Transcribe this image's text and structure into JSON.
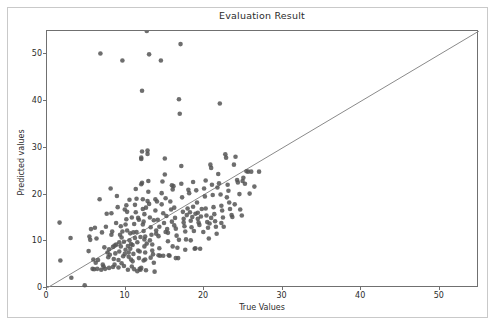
{
  "chart_data": {
    "type": "scatter",
    "title": "Evaluation Result",
    "xlabel": "True Values",
    "ylabel": "Predicted values",
    "xlim": [
      0,
      55
    ],
    "ylim": [
      0,
      55
    ],
    "xticks": [
      0,
      10,
      20,
      30,
      40,
      50
    ],
    "yticks": [
      0,
      10,
      20,
      30,
      40,
      50
    ],
    "grid": false,
    "legend": null,
    "marker_color": "#555555",
    "marker_size": 4.6,
    "marker_alpha": 0.85,
    "reference_line": {
      "name": "identity-line",
      "from": [
        0,
        0
      ],
      "to": [
        55,
        55
      ],
      "color": "#8a8a8a",
      "width": 1
    },
    "points": [
      [
        1.6,
        14.0
      ],
      [
        1.7,
        5.9
      ],
      [
        3.0,
        10.7
      ],
      [
        3.1,
        2.2
      ],
      [
        4.8,
        0.6
      ],
      [
        5.3,
        7.9
      ],
      [
        5.4,
        11.0
      ],
      [
        5.5,
        10.3
      ],
      [
        5.6,
        12.6
      ],
      [
        5.8,
        4.1
      ],
      [
        6.0,
        4.0
      ],
      [
        6.1,
        12.9
      ],
      [
        6.2,
        5.4
      ],
      [
        6.4,
        4.1
      ],
      [
        6.5,
        6.0
      ],
      [
        6.7,
        19.0
      ],
      [
        6.8,
        50.2
      ],
      [
        6.9,
        3.9
      ],
      [
        7.0,
        11.9
      ],
      [
        7.1,
        5.0
      ],
      [
        7.2,
        4.6
      ],
      [
        7.4,
        4.1
      ],
      [
        7.5,
        13.1
      ],
      [
        7.6,
        15.9
      ],
      [
        7.7,
        7.6
      ],
      [
        7.8,
        6.6
      ],
      [
        7.9,
        8.3
      ],
      [
        8.0,
        7.1
      ],
      [
        8.1,
        21.3
      ],
      [
        8.2,
        16.0
      ],
      [
        8.3,
        12.1
      ],
      [
        8.4,
        8.8
      ],
      [
        8.5,
        6.2
      ],
      [
        8.6,
        5.0
      ],
      [
        8.7,
        7.4
      ],
      [
        8.8,
        9.3
      ],
      [
        8.9,
        19.7
      ],
      [
        9.0,
        17.3
      ],
      [
        9.1,
        6.0
      ],
      [
        9.2,
        7.8
      ],
      [
        9.3,
        11.4
      ],
      [
        9.4,
        8.9
      ],
      [
        9.5,
        5.3
      ],
      [
        9.6,
        48.7
      ],
      [
        9.7,
        6.8
      ],
      [
        9.8,
        9.9
      ],
      [
        9.9,
        7.3
      ],
      [
        10.0,
        13.6
      ],
      [
        10.1,
        17.7
      ],
      [
        10.2,
        16.3
      ],
      [
        10.3,
        9.0
      ],
      [
        10.4,
        7.6
      ],
      [
        10.5,
        10.2
      ],
      [
        10.6,
        8.4
      ],
      [
        10.7,
        6.1
      ],
      [
        10.8,
        4.6
      ],
      [
        10.9,
        9.2
      ],
      [
        11.0,
        11.9
      ],
      [
        11.1,
        13.7
      ],
      [
        11.2,
        17.8
      ],
      [
        11.3,
        16.2
      ],
      [
        11.4,
        12.0
      ],
      [
        11.5,
        9.8
      ],
      [
        11.6,
        8.0
      ],
      [
        11.7,
        6.4
      ],
      [
        11.8,
        4.1
      ],
      [
        11.9,
        3.9
      ],
      [
        12.0,
        27.6
      ],
      [
        12.0,
        27.9
      ],
      [
        12.0,
        22.2
      ],
      [
        12.1,
        22.5
      ],
      [
        12.1,
        42.2
      ],
      [
        12.2,
        19.0
      ],
      [
        12.2,
        16.9
      ],
      [
        12.3,
        14.2
      ],
      [
        12.3,
        12.2
      ],
      [
        12.4,
        10.4
      ],
      [
        12.4,
        8.9
      ],
      [
        12.5,
        7.6
      ],
      [
        12.5,
        6.1
      ],
      [
        12.6,
        3.8
      ],
      [
        12.7,
        55.0
      ],
      [
        12.8,
        29.4
      ],
      [
        12.8,
        28.7
      ],
      [
        12.9,
        22.9
      ],
      [
        13.0,
        50.0
      ],
      [
        13.0,
        18.0
      ],
      [
        13.1,
        15.1
      ],
      [
        13.2,
        13.0
      ],
      [
        13.3,
        11.4
      ],
      [
        13.4,
        9.3
      ],
      [
        13.5,
        7.2
      ],
      [
        13.6,
        5.4
      ],
      [
        13.7,
        3.5
      ],
      [
        13.8,
        16.6
      ],
      [
        13.9,
        12.3
      ],
      [
        14.0,
        18.5
      ],
      [
        14.1,
        14.6
      ],
      [
        14.2,
        11.1
      ],
      [
        14.3,
        8.5
      ],
      [
        14.4,
        6.9
      ],
      [
        14.5,
        48.7
      ],
      [
        14.6,
        17.9
      ],
      [
        14.7,
        22.8
      ],
      [
        14.8,
        16.0
      ],
      [
        14.9,
        13.9
      ],
      [
        15.0,
        27.7
      ],
      [
        15.0,
        24.3
      ],
      [
        15.1,
        19.2
      ],
      [
        15.2,
        15.4
      ],
      [
        15.3,
        12.6
      ],
      [
        15.4,
        10.0
      ],
      [
        15.5,
        7.0
      ],
      [
        15.6,
        6.9
      ],
      [
        15.7,
        18.5
      ],
      [
        15.8,
        16.8
      ],
      [
        15.9,
        14.2
      ],
      [
        16.0,
        21.1
      ],
      [
        16.1,
        21.8
      ],
      [
        16.2,
        17.2
      ],
      [
        16.3,
        15.0
      ],
      [
        16.4,
        12.7
      ],
      [
        16.5,
        11.2
      ],
      [
        16.6,
        8.6
      ],
      [
        16.7,
        6.4
      ],
      [
        16.8,
        40.4
      ],
      [
        16.9,
        37.3
      ],
      [
        17.0,
        52.2
      ],
      [
        17.1,
        26.1
      ],
      [
        17.2,
        19.4
      ],
      [
        17.3,
        16.3
      ],
      [
        17.4,
        14.8
      ],
      [
        17.5,
        13.2
      ],
      [
        17.6,
        12.1
      ],
      [
        17.7,
        10.4
      ],
      [
        17.8,
        15.6
      ],
      [
        17.9,
        17.0
      ],
      [
        18.0,
        21.0
      ],
      [
        18.1,
        20.3
      ],
      [
        18.2,
        16.2
      ],
      [
        18.3,
        14.4
      ],
      [
        18.4,
        13.0
      ],
      [
        18.5,
        15.2
      ],
      [
        18.6,
        17.4
      ],
      [
        18.7,
        12.2
      ],
      [
        18.8,
        8.4
      ],
      [
        18.9,
        15.9
      ],
      [
        19.0,
        20.9
      ],
      [
        19.1,
        18.3
      ],
      [
        19.2,
        16.1
      ],
      [
        19.3,
        14.0
      ],
      [
        19.4,
        13.5
      ],
      [
        19.5,
        8.4
      ],
      [
        19.6,
        15.3
      ],
      [
        19.7,
        16.9
      ],
      [
        20.0,
        21.3
      ],
      [
        20.1,
        19.6
      ],
      [
        20.2,
        17.0
      ],
      [
        20.3,
        15.5
      ],
      [
        20.4,
        14.1
      ],
      [
        20.5,
        12.9
      ],
      [
        20.6,
        10.6
      ],
      [
        20.8,
        26.4
      ],
      [
        20.9,
        25.7
      ],
      [
        21.0,
        22.1
      ],
      [
        21.1,
        19.9
      ],
      [
        21.2,
        17.3
      ],
      [
        21.3,
        15.8
      ],
      [
        21.4,
        14.3
      ],
      [
        21.5,
        13.1
      ],
      [
        21.6,
        11.6
      ],
      [
        21.8,
        24.4
      ],
      [
        21.9,
        22.4
      ],
      [
        22.0,
        39.5
      ],
      [
        22.1,
        20.0
      ],
      [
        22.2,
        17.6
      ],
      [
        22.3,
        16.6
      ],
      [
        22.4,
        15.1
      ],
      [
        22.5,
        13.1
      ],
      [
        22.7,
        28.6
      ],
      [
        22.8,
        27.9
      ],
      [
        23.0,
        22.1
      ],
      [
        23.1,
        20.8
      ],
      [
        23.2,
        18.3
      ],
      [
        23.3,
        16.9
      ],
      [
        23.5,
        15.6
      ],
      [
        23.8,
        26.4
      ],
      [
        24.0,
        28.1
      ],
      [
        24.2,
        23.1
      ],
      [
        24.3,
        22.6
      ],
      [
        24.5,
        20.1
      ],
      [
        24.6,
        16.8
      ],
      [
        24.8,
        15.5
      ],
      [
        25.0,
        23.6
      ],
      [
        25.2,
        22.3
      ],
      [
        25.4,
        25.0
      ],
      [
        25.6,
        24.9
      ],
      [
        26.0,
        24.9
      ],
      [
        26.4,
        21.7
      ],
      [
        27.0,
        24.9
      ],
      [
        9.4,
        13.2
      ],
      [
        10.2,
        12.3
      ],
      [
        11.2,
        10.7
      ],
      [
        11.6,
        15.0
      ],
      [
        12.2,
        13.6
      ],
      [
        13.1,
        10.2
      ],
      [
        10.9,
        5.7
      ],
      [
        11.1,
        4.0
      ],
      [
        11.5,
        3.6
      ],
      [
        12.0,
        4.3
      ],
      [
        9.8,
        4.7
      ],
      [
        10.3,
        3.9
      ],
      [
        9.1,
        4.4
      ],
      [
        8.4,
        4.5
      ],
      [
        7.9,
        4.3
      ],
      [
        13.4,
        8.0
      ],
      [
        14.2,
        7.0
      ],
      [
        14.8,
        6.9
      ],
      [
        16.0,
        8.9
      ],
      [
        12.7,
        9.5
      ],
      [
        11.9,
        10.9
      ],
      [
        10.6,
        11.7
      ],
      [
        12.6,
        17.2
      ],
      [
        13.8,
        19.0
      ],
      [
        12.9,
        20.6
      ],
      [
        11.3,
        21.2
      ],
      [
        12.1,
        29.2
      ],
      [
        19.9,
        12.0
      ],
      [
        20.7,
        13.8
      ],
      [
        18.3,
        10.2
      ],
      [
        16.8,
        10.3
      ],
      [
        15.4,
        11.8
      ],
      [
        14.3,
        13.1
      ],
      [
        13.6,
        14.5
      ],
      [
        12.4,
        15.8
      ],
      [
        11.7,
        14.6
      ],
      [
        10.8,
        15.1
      ],
      [
        10.1,
        14.7
      ],
      [
        9.6,
        12.1
      ],
      [
        8.8,
        13.9
      ],
      [
        6.3,
        10.6
      ],
      [
        5.9,
        6.1
      ],
      [
        7.3,
        8.7
      ],
      [
        8.2,
        11.4
      ],
      [
        9.9,
        16.8
      ],
      [
        10.5,
        18.9
      ],
      [
        11.4,
        19.1
      ],
      [
        12.8,
        18.6
      ],
      [
        14.6,
        20.3
      ],
      [
        15.9,
        22.0
      ],
      [
        17.1,
        22.3
      ],
      [
        18.6,
        22.7
      ],
      [
        20.2,
        23.0
      ],
      [
        21.7,
        21.5
      ],
      [
        22.9,
        19.4
      ],
      [
        23.9,
        17.9
      ],
      [
        16.4,
        6.4
      ],
      [
        17.6,
        8.2
      ],
      [
        18.9,
        8.5
      ],
      [
        13.2,
        6.5
      ],
      [
        10.0,
        8.2
      ],
      [
        10.4,
        6.7
      ],
      [
        11.0,
        7.3
      ],
      [
        11.8,
        7.8
      ],
      [
        12.3,
        5.9
      ],
      [
        9.2,
        9.8
      ],
      [
        8.6,
        9.1
      ],
      [
        9.5,
        10.8
      ],
      [
        10.7,
        9.4
      ],
      [
        12.5,
        11.0
      ],
      [
        13.9,
        11.6
      ],
      [
        15.1,
        12.0
      ],
      [
        16.2,
        13.4
      ],
      [
        17.4,
        14.0
      ],
      [
        19.2,
        14.8
      ],
      [
        20.9,
        15.0
      ],
      [
        22.2,
        13.9
      ],
      [
        23.6,
        15.2
      ],
      [
        25.8,
        20.2
      ],
      [
        24.9,
        22.9
      ]
    ]
  },
  "figure": {
    "background_color": "#ffffff",
    "frame_color": "#c9c9c9",
    "axes_color": "#707070"
  }
}
